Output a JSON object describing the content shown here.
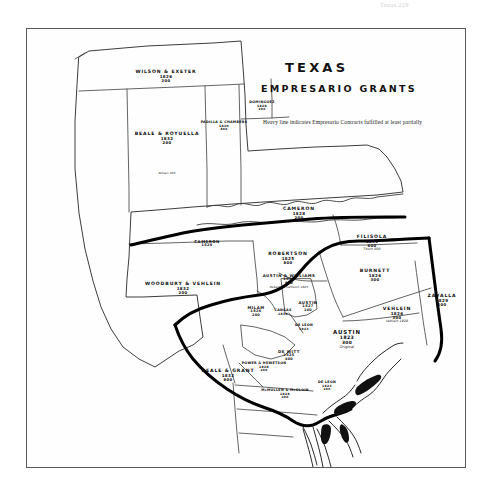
{
  "scan": {
    "header_text": "Texas    229"
  },
  "map": {
    "title": "TEXAS",
    "subtitle": "EMPRESARIO GRANTS",
    "legend_note": "Heavy line indicates Empresario Contracts fulfilled at least partially",
    "frame_color": "#5a5a5a",
    "ink_color": "#111111",
    "paper_color": "#fefefe",
    "heavy_line_color": "#000000",
    "thin_line_color": "#4a4a4a",
    "grants": [
      {
        "id": "wilson-exeter",
        "name": "WILSON & EXETER",
        "year": "1826",
        "count": "200",
        "note": "",
        "x": 139,
        "y": 41,
        "size": "s8"
      },
      {
        "id": "beale-royuella",
        "name": "BEALE & ROYUELLA",
        "year": "1832",
        "count": "200",
        "note": "",
        "x": 140,
        "y": 103,
        "size": "s8"
      },
      {
        "id": "wilson-200",
        "name": "",
        "year": "",
        "count": "",
        "note": "Wilson 200",
        "x": 140,
        "y": 143,
        "size": "s7"
      },
      {
        "id": "padilla-chambers",
        "name": "PADILLA & CHAMBERS",
        "year": "1830",
        "count": "800",
        "note": "",
        "x": 197,
        "y": 92,
        "size": "s6"
      },
      {
        "id": "dominguez",
        "name": "DOMINGUEZ",
        "year": "1828",
        "count": "200",
        "note": "",
        "x": 235,
        "y": 72,
        "size": "s6"
      },
      {
        "id": "cameron-1828",
        "name": "CAMERON",
        "year": "1828",
        "count": "200",
        "note": "",
        "x": 272,
        "y": 178,
        "size": "s8"
      },
      {
        "id": "cameron-west",
        "name": "CAMERON",
        "year": "1828",
        "count": "",
        "note": "",
        "x": 180,
        "y": 211,
        "size": "s7"
      },
      {
        "id": "filisola",
        "name": "FILISOLA",
        "year": "1831",
        "count": "600",
        "note": "Thorn 600",
        "x": 345,
        "y": 206,
        "size": "s8"
      },
      {
        "id": "robertson",
        "name": "ROBERTSON",
        "year": "1825",
        "count": "800",
        "note": "",
        "x": 261,
        "y": 223,
        "size": "s8"
      },
      {
        "id": "austin-williams",
        "name": "AUSTIN & WILLIAMS",
        "year": "1831",
        "count": "800",
        "note": "Robertson Leftwich 1825",
        "x": 262,
        "y": 245,
        "size": "s7"
      },
      {
        "id": "burnett",
        "name": "BURNETT",
        "year": "1826",
        "count": "300",
        "note": "",
        "x": 348,
        "y": 240,
        "size": "s8"
      },
      {
        "id": "zavalla",
        "name": "ZAVALLA",
        "year": "1829",
        "count": "500",
        "note": "",
        "x": 415,
        "y": 265,
        "size": "s8"
      },
      {
        "id": "vehlein",
        "name": "VEHLEIN",
        "year": "1826",
        "count": "300",
        "note": "Vehlein 1828",
        "x": 370,
        "y": 278,
        "size": "s8"
      },
      {
        "id": "woodbury-vehlein",
        "name": "WOODBURY & VEHLEIN",
        "year": "1832",
        "count": "200",
        "note": "",
        "x": 156,
        "y": 253,
        "size": "s8"
      },
      {
        "id": "milam",
        "name": "MILAM",
        "year": "1826",
        "count": "200",
        "note": "",
        "x": 229,
        "y": 277,
        "size": "s7"
      },
      {
        "id": "cangas",
        "name": "CANGAS",
        "year": "1830",
        "count": "",
        "note": "",
        "x": 256,
        "y": 280,
        "size": "s6"
      },
      {
        "id": "austin-little-colony",
        "name": "AUSTIN",
        "year": "1827",
        "count": "100",
        "note": "",
        "x": 281,
        "y": 272,
        "size": "s7"
      },
      {
        "id": "deleon",
        "name": "DE LEON",
        "year": "1824",
        "count": "",
        "note": "",
        "x": 277,
        "y": 295,
        "size": "s6"
      },
      {
        "id": "dewitt",
        "name": "DE WITT",
        "year": "1825",
        "count": "400",
        "note": "",
        "x": 262,
        "y": 321,
        "size": "s7"
      },
      {
        "id": "austin-main",
        "name": "AUSTIN",
        "year": "1823",
        "count": "300",
        "note": "Original",
        "x": 320,
        "y": 301,
        "size": "s9"
      },
      {
        "id": "beale-grant",
        "name": "BEALE & GRANT",
        "year": "1832",
        "count": "800",
        "note": "",
        "x": 201,
        "y": 340,
        "size": "s8"
      },
      {
        "id": "power-hewetson",
        "name": "POWER & HEWETSON",
        "year": "1828",
        "count": "200",
        "note": "",
        "x": 237,
        "y": 333,
        "size": "s6"
      },
      {
        "id": "mcmullen-mcgloin",
        "name": "McMULLEN & McGLOIN",
        "year": "1828",
        "count": "200",
        "note": "",
        "x": 258,
        "y": 360,
        "size": "s6"
      },
      {
        "id": "deleon-coast",
        "name": "DE LEON",
        "year": "1824",
        "count": "200",
        "note": "",
        "x": 300,
        "y": 352,
        "size": "s6"
      }
    ]
  }
}
